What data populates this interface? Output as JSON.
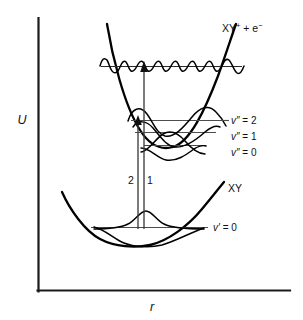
{
  "figure": {
    "type": "potential-energy-curve-diagram"
  },
  "axes": {
    "y_label": "U",
    "x_label": "r",
    "y_axis_name": "potential-energy-axis",
    "x_axis_name": "internuclear-distance-axis"
  },
  "states": {
    "ion": {
      "label_main": "XY",
      "label_sup_plus": "+",
      "label_plus_electron": " + e",
      "label_sup_minus": "−",
      "label_full": "XY⁺ + e⁻",
      "curve_name": "ion-potential-curve"
    },
    "neutral": {
      "label": "XY",
      "curve_name": "neutral-potential-curve"
    }
  },
  "vibrational_levels": {
    "ion": [
      {
        "sym": "v″",
        "eq": " = 2",
        "text": "v″ = 2"
      },
      {
        "sym": "v″",
        "eq": " = 1",
        "text": "v″ = 1"
      },
      {
        "sym": "v″",
        "eq": " = 0",
        "text": "v″ = 0"
      }
    ],
    "neutral": [
      {
        "sym": "v′",
        "eq": " = 0",
        "text": "v′ = 0"
      }
    ]
  },
  "transitions": [
    {
      "id": "2",
      "label": "2",
      "name": "transition-arrow-2",
      "target": "v″ = 2"
    },
    {
      "id": "1",
      "label": "1",
      "name": "transition-arrow-1",
      "target": "ionization continuum"
    }
  ],
  "continuum": {
    "name": "ionization-continuum-level",
    "description": "oscillatory continuum wavefunction"
  },
  "colors": {
    "ink": "#000000",
    "axis": "#1a1a1a",
    "level": "#4d4d4d",
    "arrow": "#3d3d3d",
    "background": "#ffffff"
  }
}
